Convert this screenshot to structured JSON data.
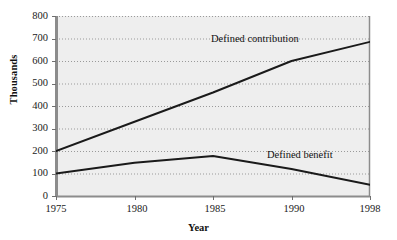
{
  "chart_data": {
    "type": "line",
    "title": "",
    "subtitle": "",
    "xlabel": "Year",
    "ylabel": "Thousands",
    "x": [
      1975,
      1980,
      1985,
      1990,
      1998
    ],
    "categories": [
      "1975",
      "1980",
      "1985",
      "1990",
      "1998"
    ],
    "xtick_labels": [
      "1975",
      "1980",
      "1985",
      "1990",
      "1998"
    ],
    "ytick_labels": [
      "0",
      "100",
      "200",
      "300",
      "400",
      "500",
      "600",
      "700",
      "800"
    ],
    "yticks": [
      0,
      100,
      200,
      300,
      400,
      500,
      600,
      700,
      800
    ],
    "ylim": [
      0,
      800
    ],
    "grid": true,
    "grid_style": "dotted-horizontal",
    "legend_position": "inline-annotations",
    "series": [
      {
        "name": "Defined contribution",
        "values": [
          200,
          330,
          460,
          600,
          685
        ],
        "color": "#1a1a1a",
        "label_x": 1986.2,
        "label_y": 735
      },
      {
        "name": "Defined benefit",
        "values": [
          100,
          148,
          178,
          120,
          50
        ],
        "color": "#1a1a1a",
        "label_x": 1990.7,
        "label_y": 198
      }
    ],
    "annotations": [
      {
        "text": "Defined contribution"
      },
      {
        "text": "Defined benefit"
      }
    ],
    "plot_bg_color": "#eeeeee",
    "axis_color": "#8c8c8c",
    "line_color": "#1a1a1a"
  },
  "axes": {
    "y_axis_title": "Thousands",
    "x_axis_title": "Year"
  },
  "ticks": {
    "y": [
      {
        "label": "800",
        "value": 800
      },
      {
        "label": "700",
        "value": 700
      },
      {
        "label": "600",
        "value": 600
      },
      {
        "label": "500",
        "value": 500
      },
      {
        "label": "400",
        "value": 400
      },
      {
        "label": "300",
        "value": 300
      },
      {
        "label": "200",
        "value": 200
      },
      {
        "label": "100",
        "value": 100
      },
      {
        "label": "0",
        "value": 0
      }
    ],
    "x": [
      {
        "label": "1975"
      },
      {
        "label": "1980"
      },
      {
        "label": "1985"
      },
      {
        "label": "1990"
      },
      {
        "label": "1998"
      }
    ]
  },
  "series_labels": {
    "upper": "Defined contribution",
    "lower": "Defined benefit"
  }
}
